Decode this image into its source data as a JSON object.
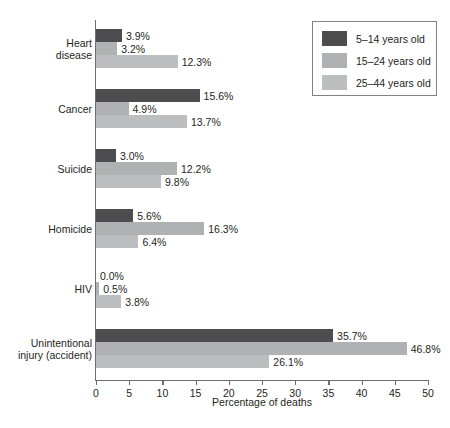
{
  "chart_data": {
    "type": "bar",
    "orientation": "horizontal",
    "title": "",
    "xlabel": "Percentage of deaths",
    "ylabel": "",
    "xlim": [
      0,
      50
    ],
    "xticks": [
      0,
      5,
      10,
      15,
      20,
      25,
      30,
      35,
      40,
      45,
      50
    ],
    "xtick_labels": [
      "0",
      "5",
      "10",
      "15",
      "20",
      "25",
      "30",
      "35",
      "40",
      "45",
      "50"
    ],
    "grid": false,
    "legend_position": "top-right",
    "value_suffix": "%",
    "categories": [
      "Heart disease",
      "Cancer",
      "Suicide",
      "Homicide",
      "HIV",
      "Unintentional injury (accident)"
    ],
    "category_lines": [
      [
        "Heart",
        "disease"
      ],
      [
        "Cancer"
      ],
      [
        "Suicide"
      ],
      [
        "Homicide"
      ],
      [
        "HIV"
      ],
      [
        "Unintentional",
        "injury (accident)"
      ]
    ],
    "series": [
      {
        "name": "5–14 years old",
        "color": "#4d4d4f",
        "values": [
          3.9,
          15.6,
          3.0,
          5.6,
          0.0,
          35.7
        ],
        "labels": [
          "3.9%",
          "15.6%",
          "3.0%",
          "5.6%",
          "0.0%",
          "35.7%"
        ]
      },
      {
        "name": "15–24 years old",
        "color": "#b0b1b3",
        "values": [
          3.2,
          4.9,
          12.2,
          16.3,
          0.5,
          46.8
        ],
        "labels": [
          "3.2%",
          "4.9%",
          "12.2%",
          "16.3%",
          "0.5%",
          "46.8%"
        ]
      },
      {
        "name": "25–44 years old",
        "color": "#bdbec0",
        "values": [
          12.3,
          13.7,
          9.8,
          6.4,
          3.8,
          26.1
        ],
        "labels": [
          "12.3%",
          "13.7%",
          "9.8%",
          "6.4%",
          "3.8%",
          "26.1%"
        ]
      }
    ]
  },
  "legend": {
    "items": [
      {
        "label": "5–14 years old",
        "color": "#4d4d4f"
      },
      {
        "label": "15–24 years old",
        "color": "#b0b1b3"
      },
      {
        "label": "25–44 years old",
        "color": "#bdbec0"
      }
    ]
  },
  "axis": {
    "x_title": "Percentage of deaths"
  }
}
